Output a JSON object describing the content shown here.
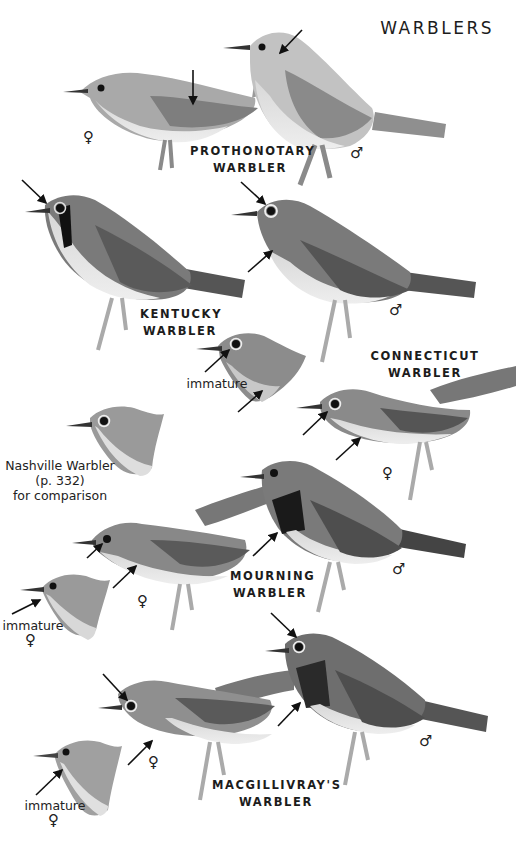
{
  "page": {
    "title": "WARBLERS",
    "background": "#ffffff"
  },
  "species": [
    {
      "id": "prothonotary",
      "label_line1": "PROTHONOTARY",
      "label_line2": "WARBLER",
      "figures": [
        {
          "sex": "♀",
          "sex_label": "female",
          "tone": "#a8a8a8"
        },
        {
          "sex": "♂",
          "sex_label": "male",
          "tone": "#c4c4c4"
        }
      ]
    },
    {
      "id": "kentucky",
      "label_line1": "KENTUCKY",
      "label_line2": "WARBLER",
      "figures": [
        {
          "sex": "",
          "sex_label": "adult",
          "tone": "#7d7d7d"
        }
      ]
    },
    {
      "id": "connecticut",
      "label_line1": "CONNECTICUT",
      "label_line2": "WARBLER",
      "figures": [
        {
          "sex": "♂",
          "sex_label": "male",
          "tone": "#7a7a7a"
        },
        {
          "sex": "",
          "sex_label": "immature",
          "note": "immature",
          "tone": "#8c8c8c"
        },
        {
          "sex": "♀",
          "sex_label": "female",
          "tone": "#8a8a8a"
        }
      ]
    },
    {
      "id": "nashville",
      "note_line1": "Nashville Warbler",
      "note_line2": "(p. 332)",
      "note_line3": "for comparison",
      "figures": [
        {
          "sex": "",
          "sex_label": "comparison head",
          "tone": "#9a9a9a"
        }
      ]
    },
    {
      "id": "mourning",
      "label_line1": "MOURNING",
      "label_line2": "WARBLER",
      "figures": [
        {
          "sex": "♀",
          "sex_label": "female",
          "tone": "#888888"
        },
        {
          "sex": "♂",
          "sex_label": "male",
          "tone": "#7a7a7a"
        },
        {
          "sex": "♀",
          "sex_label": "immature female",
          "note": "immature",
          "tone": "#9a9a9a"
        }
      ]
    },
    {
      "id": "macgillivrays",
      "label_line1": "MACGILLIVRAY'S",
      "label_line2": "WARBLER",
      "figures": [
        {
          "sex": "♀",
          "sex_label": "female",
          "tone": "#8f8f8f"
        },
        {
          "sex": "♂",
          "sex_label": "male",
          "tone": "#6f6f6f"
        },
        {
          "sex": "♀",
          "sex_label": "immature female",
          "note": "immature",
          "tone": "#a0a0a0"
        }
      ]
    }
  ]
}
